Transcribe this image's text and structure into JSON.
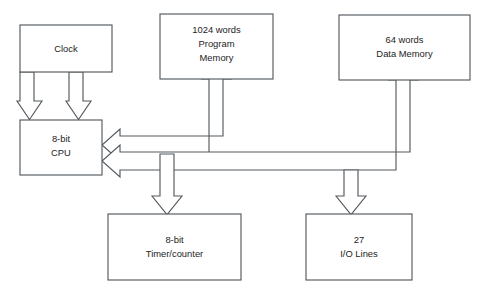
{
  "diagram": {
    "background_color": "#ffffff",
    "line_color": "#555a5e",
    "text_color": "#1d1d1d",
    "blocks": [
      {
        "id": "clock",
        "name": "clock-block",
        "lines": [
          "Clock"
        ],
        "x": 20,
        "y": 25,
        "w": 92,
        "h": 47
      },
      {
        "id": "program-memory",
        "name": "program-memory-block",
        "lines": [
          "1024 words",
          "Program",
          "Memory"
        ],
        "x": 160,
        "y": 14,
        "w": 113,
        "h": 65
      },
      {
        "id": "data-memory",
        "name": "data-memory-block",
        "lines": [
          "64 words",
          "Data Memory"
        ],
        "x": 339,
        "y": 15,
        "w": 131,
        "h": 65
      },
      {
        "id": "cpu",
        "name": "cpu-block",
        "lines": [
          "8-bit",
          "CPU"
        ],
        "x": 20,
        "y": 120,
        "w": 82,
        "h": 55
      },
      {
        "id": "timer-counter",
        "name": "timer-counter-block",
        "lines": [
          "8-bit",
          "Timer/counter"
        ],
        "x": 108,
        "y": 214,
        "w": 133,
        "h": 66
      },
      {
        "id": "io-lines",
        "name": "io-lines-block",
        "lines": [
          "27",
          "I/O Lines"
        ],
        "x": 306,
        "y": 214,
        "w": 106,
        "h": 66
      }
    ],
    "connectors": [
      {
        "id": "clock-to-cpu-left",
        "name": "clock-to-cpu-arrow-left",
        "from": "clock",
        "to": "cpu",
        "direction": "down"
      },
      {
        "id": "clock-to-cpu-right",
        "name": "clock-to-cpu-arrow-right",
        "from": "clock",
        "to": "cpu",
        "direction": "down"
      },
      {
        "id": "program-memory-bus",
        "name": "cpu-program-memory-bus",
        "from": "cpu",
        "to": "program-memory",
        "direction": "bidirectional"
      },
      {
        "id": "data-memory-bus",
        "name": "cpu-data-memory-bus",
        "from": "cpu",
        "to": "data-memory",
        "direction": "bidirectional"
      },
      {
        "id": "timer-bus",
        "name": "cpu-timer-counter-bus",
        "from": "cpu",
        "to": "timer-counter",
        "direction": "down"
      },
      {
        "id": "io-bus",
        "name": "cpu-io-lines-bus",
        "from": "cpu",
        "to": "io-lines",
        "direction": "down"
      }
    ]
  }
}
